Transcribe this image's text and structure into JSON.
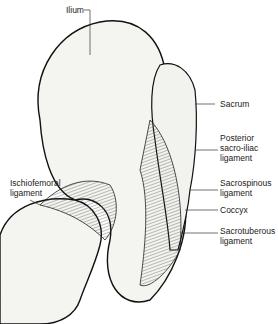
{
  "labels": {
    "ilium": "Ilium",
    "ischiofemoral": "Ischiofemoral\nligament",
    "sacrum": "Sacrum",
    "posterior_sacroiliac": "Posterior\nsacro-iliac\nligament",
    "sacrospinous": "Sacrospinous\nligament",
    "coccyx": "Coccyx",
    "sacrotuberous": "Sacrotuberous\nligament"
  }
}
